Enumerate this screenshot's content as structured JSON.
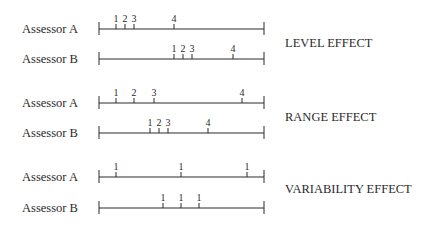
{
  "panels": [
    {
      "effect_label": "LEVEL EFFECT",
      "effect_y": 47,
      "rows": [
        {
          "label": "Assessor A",
          "line_y": 29,
          "ticks": [
            {
              "x": 116,
              "t": "1"
            },
            {
              "x": 125,
              "t": "2"
            },
            {
              "x": 134,
              "t": "3"
            },
            {
              "x": 174,
              "t": "4"
            }
          ]
        },
        {
          "label": "Assessor B",
          "line_y": 59,
          "ticks": [
            {
              "x": 174,
              "t": "1"
            },
            {
              "x": 183,
              "t": "2"
            },
            {
              "x": 192,
              "t": "3"
            },
            {
              "x": 233,
              "t": "4"
            }
          ]
        }
      ]
    },
    {
      "effect_label": "RANGE EFFECT",
      "effect_y": 121,
      "rows": [
        {
          "label": "Assessor A",
          "line_y": 103,
          "ticks": [
            {
              "x": 116,
              "t": "1"
            },
            {
              "x": 134,
              "t": "2"
            },
            {
              "x": 154,
              "t": "3"
            },
            {
              "x": 242,
              "t": "4"
            }
          ]
        },
        {
          "label": "Assessor B",
          "line_y": 133,
          "ticks": [
            {
              "x": 150,
              "t": "1"
            },
            {
              "x": 159,
              "t": "2"
            },
            {
              "x": 168,
              "t": "3"
            },
            {
              "x": 208,
              "t": "4"
            }
          ]
        }
      ]
    },
    {
      "effect_label": "VARIABILITY EFFECT",
      "effect_y": 193,
      "rows": [
        {
          "label": "Assessor A",
          "line_y": 177,
          "ticks": [
            {
              "x": 116,
              "t": "1"
            },
            {
              "x": 181,
              "t": "1"
            },
            {
              "x": 247,
              "t": "1"
            }
          ]
        },
        {
          "label": "Assessor B",
          "line_y": 208,
          "ticks": [
            {
              "x": 163,
              "t": "1"
            },
            {
              "x": 181,
              "t": "1"
            },
            {
              "x": 199,
              "t": "1"
            }
          ]
        }
      ]
    }
  ],
  "scale": {
    "left_x": 99,
    "right_x": 264
  },
  "colors": {
    "ink": "#2a2a2a",
    "background": "#ffffff"
  }
}
